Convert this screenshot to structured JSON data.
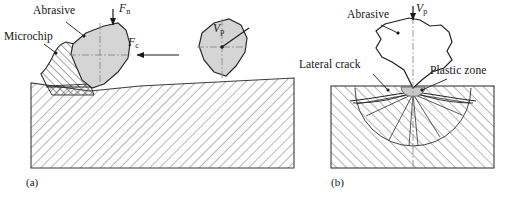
{
  "figure": {
    "type": "technical-diagram",
    "panels": [
      {
        "id": "a",
        "caption": "(a)",
        "caption_x": 26,
        "caption_y": 176,
        "description": "Abrasive grain cutting producing a microchip on a hatched workpiece",
        "labels": [
          {
            "name": "abrasive",
            "text": "Abrasive",
            "italic": false,
            "x": 33,
            "y": 11
          },
          {
            "name": "microchip",
            "text": "Microchip",
            "italic": false,
            "x": 4,
            "y": 36
          },
          {
            "name": "normal-force",
            "text": "F",
            "sub": "n",
            "italic": true,
            "x": 123,
            "y": 7
          },
          {
            "name": "cutting-force",
            "text": "F",
            "sub": "c",
            "italic": true,
            "x": 128,
            "y": 42
          },
          {
            "name": "peripheral-velocity",
            "text": "V",
            "sub": "p",
            "italic": true,
            "x": 212,
            "y": 27
          }
        ],
        "workpiece": {
          "x": 31,
          "y": 78,
          "width": 263,
          "height": 90,
          "hatch": "diagonal"
        },
        "grains": [
          {
            "name": "cutting-grain",
            "cx": 89,
            "cy": 57,
            "fill": "#d5d5d5"
          },
          {
            "name": "trailing-grain",
            "cx": 222,
            "cy": 47,
            "fill": "#d5d5d5"
          }
        ]
      },
      {
        "id": "b",
        "caption": "(b)",
        "caption_x": 331,
        "caption_y": 176,
        "description": "Indentation fracture showing plastic zone, lateral cracks and median crack",
        "labels": [
          {
            "name": "abrasive",
            "text": "Abrasive",
            "italic": false,
            "x": 347,
            "y": 14
          },
          {
            "name": "peripheral-velocity",
            "text": "V",
            "sub": "p",
            "italic": true,
            "x": 415,
            "y": 7
          },
          {
            "name": "lateral-crack",
            "text": "Lateral crack",
            "italic": false,
            "x": 326,
            "y": 64
          },
          {
            "name": "plastic-zone",
            "text": "Plastic zone",
            "italic": false,
            "x": 430,
            "y": 70
          }
        ],
        "workpiece": {
          "x": 331,
          "y": 86,
          "width": 163,
          "height": 82,
          "hatch": "diagonal"
        },
        "indenter": {
          "name": "abrasive-blob",
          "tip_x": 413,
          "tip_y": 88,
          "fill": "#ffffff"
        },
        "plastic_zone": {
          "cx": 413,
          "cy": 88,
          "rx": 12,
          "ry": 9,
          "fill": "#c9c9c9"
        }
      }
    ],
    "colors": {
      "line": "#1a1a1a",
      "grain_fill": "#d5d5d5",
      "plastic_fill": "#c9c9c9",
      "hatch": "#7b7b7b",
      "background": "#ffffff"
    }
  }
}
